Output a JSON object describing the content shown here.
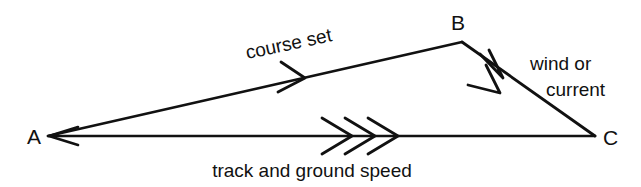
{
  "diagram": {
    "background_color": "#ffffff",
    "ink_color": "#111111",
    "vertices": [
      {
        "id": "A",
        "label": "A",
        "x": 48,
        "y": 136,
        "label_x": 27,
        "label_y": 144
      },
      {
        "id": "B",
        "label": "B",
        "x": 462,
        "y": 42,
        "label_x": 451,
        "label_y": 30
      },
      {
        "id": "C",
        "label": "C",
        "x": 595,
        "y": 136,
        "label_x": 603,
        "label_y": 145
      }
    ],
    "edges": [
      {
        "id": "course-set",
        "from": "A",
        "to": "B",
        "label": "course set",
        "label_x": 290,
        "label_y": 50,
        "label_rotation": -12,
        "arrow_count": 1,
        "arrow_position_x": 302,
        "arrow_position_y": 78
      },
      {
        "id": "wind-or-current",
        "from": "B",
        "to": "C",
        "label_line_1": "wind or",
        "label_line_2": "current",
        "label_1_x": 530,
        "label_1_y": 70,
        "label_2_x": 546,
        "label_2_y": 96,
        "arrow_count": 2,
        "arrow_position_x": 497,
        "arrow_position_y": 73
      },
      {
        "id": "track-and-ground-speed",
        "from": "A",
        "to": "C",
        "label": "track and ground speed",
        "label_x": 312,
        "label_y": 177,
        "arrow_count": 3,
        "arrow_position_x": 356,
        "arrow_position_y": 136
      }
    ]
  }
}
